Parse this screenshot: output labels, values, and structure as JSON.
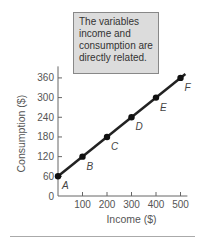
{
  "note": {
    "lines": [
      "The variables",
      "income and",
      "consumption are",
      "directly related."
    ]
  },
  "chart_data": {
    "type": "line",
    "title": "",
    "xlabel": "Income ($)",
    "ylabel": "Consumption ($)",
    "x": [
      0,
      100,
      200,
      300,
      400,
      500
    ],
    "series": [
      {
        "name": "Consumption",
        "values": [
          60,
          120,
          180,
          240,
          300,
          360
        ]
      }
    ],
    "point_labels": [
      "A",
      "B",
      "C",
      "D",
      "E",
      "F"
    ],
    "x_ticks": [
      "100",
      "200",
      "300",
      "400",
      "500"
    ],
    "y_ticks": [
      "0",
      "60",
      "120",
      "180",
      "240",
      "300",
      "360"
    ],
    "xlim": [
      0,
      520
    ],
    "ylim": [
      0,
      380
    ],
    "annotation": "The variables income and consumption are directly related.",
    "grid": false
  }
}
